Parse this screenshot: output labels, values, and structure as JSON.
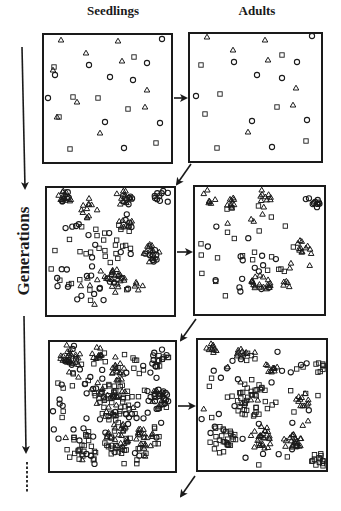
{
  "figure": {
    "column_titles": {
      "seedlings": "Seedlings",
      "adults": "Adults"
    },
    "axis_label": "Generations",
    "colors": {
      "ink": "#1a1a1a",
      "background": "#ffffff"
    },
    "marker_legend": [
      "triangle",
      "circle",
      "square"
    ]
  },
  "panels": [
    {
      "id": "gen1-seedlings",
      "box": [
        43,
        34,
        172,
        163
      ],
      "markers": {
        "triangle": [
          [
            61,
            40
          ],
          [
            118,
            41
          ],
          [
            86,
            53
          ],
          [
            122,
            61
          ],
          [
            147,
            90
          ],
          [
            77,
            102
          ],
          [
            57,
            117
          ],
          [
            145,
            107
          ],
          [
            100,
            133
          ],
          [
            53,
            70
          ]
        ],
        "circle": [
          [
            162,
            39
          ],
          [
            89,
            65
          ],
          [
            147,
            63
          ],
          [
            55,
            75
          ],
          [
            110,
            77
          ],
          [
            133,
            80
          ],
          [
            48,
            98
          ],
          [
            105,
            122
          ],
          [
            160,
            123
          ],
          [
            124,
            148
          ]
        ],
        "square": [
          [
            134,
            57
          ],
          [
            54,
            67
          ],
          [
            73,
            97
          ],
          [
            98,
            98
          ],
          [
            128,
            109
          ],
          [
            59,
            117
          ],
          [
            70,
            149
          ],
          [
            156,
            143
          ]
        ]
      }
    },
    {
      "id": "gen1-adults",
      "box": [
        189,
        33,
        322,
        162
      ],
      "markers": {
        "triangle": [
          [
            207,
            37
          ],
          [
            265,
            40
          ],
          [
            233,
            50
          ],
          [
            268,
            60
          ],
          [
            296,
            88
          ],
          [
            293,
            105
          ],
          [
            248,
            132
          ]
        ],
        "circle": [
          [
            312,
            36
          ],
          [
            234,
            62
          ],
          [
            297,
            62
          ],
          [
            257,
            75
          ],
          [
            282,
            78
          ],
          [
            196,
            96
          ],
          [
            252,
            121
          ],
          [
            307,
            120
          ],
          [
            272,
            147
          ]
        ],
        "square": [
          [
            282,
            55
          ],
          [
            201,
            65
          ],
          [
            220,
            94
          ],
          [
            277,
            107
          ],
          [
            205,
            114
          ],
          [
            217,
            148
          ],
          [
            306,
            141
          ]
        ]
      }
    },
    {
      "id": "gen2-seedlings",
      "box": [
        46,
        187,
        175,
        316
      ],
      "seed": 11,
      "clusters": [
        {
          "type": "triangle",
          "cx": 65,
          "cy": 196,
          "r": 8,
          "n": 14
        },
        {
          "type": "circle",
          "cx": 66,
          "cy": 197,
          "r": 6,
          "n": 5
        },
        {
          "type": "triangle",
          "cx": 89,
          "cy": 208,
          "r": 10,
          "n": 12
        },
        {
          "type": "triangle",
          "cx": 124,
          "cy": 196,
          "r": 9,
          "n": 14
        },
        {
          "type": "circle",
          "cx": 126,
          "cy": 200,
          "r": 8,
          "n": 5
        },
        {
          "type": "circle",
          "cx": 162,
          "cy": 197,
          "r": 9,
          "n": 10
        },
        {
          "type": "triangle",
          "cx": 126,
          "cy": 225,
          "r": 8,
          "n": 8
        },
        {
          "type": "circle",
          "cx": 132,
          "cy": 220,
          "r": 10,
          "n": 5
        },
        {
          "type": "triangle",
          "cx": 151,
          "cy": 253,
          "r": 9,
          "n": 14
        },
        {
          "type": "circle",
          "cx": 149,
          "cy": 255,
          "r": 10,
          "n": 8
        },
        {
          "type": "triangle",
          "cx": 116,
          "cy": 279,
          "r": 10,
          "n": 20
        },
        {
          "type": "circle",
          "cx": 114,
          "cy": 278,
          "r": 8,
          "n": 5
        },
        {
          "type": "triangle",
          "cx": 139,
          "cy": 285,
          "r": 5,
          "n": 5
        },
        {
          "type": "square",
          "cx": 95,
          "cy": 260,
          "r": 45,
          "n": 32
        },
        {
          "type": "circle",
          "cx": 90,
          "cy": 265,
          "r": 45,
          "n": 25
        },
        {
          "type": "triangle",
          "cx": 100,
          "cy": 290,
          "r": 20,
          "n": 8
        }
      ]
    },
    {
      "id": "gen2-adults",
      "box": [
        194,
        186,
        325,
        315
      ],
      "seed": 23,
      "clusters": [
        {
          "type": "triangle",
          "cx": 209,
          "cy": 196,
          "r": 8,
          "n": 7
        },
        {
          "type": "triangle",
          "cx": 231,
          "cy": 203,
          "r": 6,
          "n": 9
        },
        {
          "type": "triangle",
          "cx": 266,
          "cy": 195,
          "r": 7,
          "n": 8
        },
        {
          "type": "circle",
          "cx": 313,
          "cy": 202,
          "r": 8,
          "n": 11
        },
        {
          "type": "triangle",
          "cx": 304,
          "cy": 246,
          "r": 7,
          "n": 10
        },
        {
          "type": "triangle",
          "cx": 261,
          "cy": 283,
          "r": 10,
          "n": 18
        },
        {
          "type": "triangle",
          "cx": 286,
          "cy": 285,
          "r": 4,
          "n": 5
        },
        {
          "type": "triangle",
          "cx": 300,
          "cy": 262,
          "r": 16,
          "n": 5
        },
        {
          "type": "square",
          "cx": 245,
          "cy": 250,
          "r": 50,
          "n": 24
        },
        {
          "type": "circle",
          "cx": 250,
          "cy": 250,
          "r": 50,
          "n": 16
        },
        {
          "type": "triangle",
          "cx": 255,
          "cy": 215,
          "r": 30,
          "n": 6
        }
      ]
    },
    {
      "id": "gen3-seedlings",
      "box": [
        49,
        341,
        176,
        472
      ],
      "seed": 37,
      "clusters": [
        {
          "type": "triangle",
          "cx": 70,
          "cy": 353,
          "r": 11,
          "n": 22
        },
        {
          "type": "circle",
          "cx": 72,
          "cy": 355,
          "r": 10,
          "n": 8
        },
        {
          "type": "triangle",
          "cx": 97,
          "cy": 353,
          "r": 6,
          "n": 12
        },
        {
          "type": "circle",
          "cx": 160,
          "cy": 358,
          "r": 10,
          "n": 10
        },
        {
          "type": "square",
          "cx": 161,
          "cy": 360,
          "r": 8,
          "n": 8
        },
        {
          "type": "triangle",
          "cx": 118,
          "cy": 372,
          "r": 9,
          "n": 14
        },
        {
          "type": "circle",
          "cx": 158,
          "cy": 398,
          "r": 11,
          "n": 20
        },
        {
          "type": "triangle",
          "cx": 158,
          "cy": 398,
          "r": 10,
          "n": 10
        },
        {
          "type": "square",
          "cx": 113,
          "cy": 400,
          "r": 20,
          "n": 40
        },
        {
          "type": "triangle",
          "cx": 110,
          "cy": 400,
          "r": 14,
          "n": 14
        },
        {
          "type": "triangle",
          "cx": 118,
          "cy": 436,
          "r": 13,
          "n": 24
        },
        {
          "type": "square",
          "cx": 118,
          "cy": 440,
          "r": 14,
          "n": 18
        },
        {
          "type": "triangle",
          "cx": 145,
          "cy": 438,
          "r": 11,
          "n": 16
        },
        {
          "type": "square",
          "cx": 82,
          "cy": 450,
          "r": 16,
          "n": 22
        },
        {
          "type": "circle",
          "cx": 110,
          "cy": 410,
          "r": 60,
          "n": 50
        },
        {
          "type": "square",
          "cx": 110,
          "cy": 410,
          "r": 60,
          "n": 50
        },
        {
          "type": "triangle",
          "cx": 110,
          "cy": 410,
          "r": 60,
          "n": 15
        }
      ]
    },
    {
      "id": "gen3-adults",
      "box": [
        197,
        339,
        327,
        471
      ],
      "seed": 53,
      "clusters": [
        {
          "type": "triangle",
          "cx": 212,
          "cy": 347,
          "r": 7,
          "n": 10
        },
        {
          "type": "triangle",
          "cx": 241,
          "cy": 352,
          "r": 6,
          "n": 10
        },
        {
          "type": "triangle",
          "cx": 271,
          "cy": 367,
          "r": 6,
          "n": 10
        },
        {
          "type": "triangle",
          "cx": 303,
          "cy": 400,
          "r": 7,
          "n": 12
        },
        {
          "type": "square",
          "cx": 252,
          "cy": 400,
          "r": 18,
          "n": 38
        },
        {
          "type": "square",
          "cx": 222,
          "cy": 440,
          "r": 14,
          "n": 26
        },
        {
          "type": "triangle",
          "cx": 262,
          "cy": 438,
          "r": 12,
          "n": 26
        },
        {
          "type": "triangle",
          "cx": 292,
          "cy": 443,
          "r": 10,
          "n": 20
        },
        {
          "type": "square",
          "cx": 318,
          "cy": 460,
          "r": 8,
          "n": 14
        },
        {
          "type": "square",
          "cx": 320,
          "cy": 365,
          "r": 8,
          "n": 8
        },
        {
          "type": "circle",
          "cx": 262,
          "cy": 405,
          "r": 62,
          "n": 28
        },
        {
          "type": "square",
          "cx": 262,
          "cy": 405,
          "r": 62,
          "n": 22
        },
        {
          "type": "triangle",
          "cx": 262,
          "cy": 405,
          "r": 62,
          "n": 12
        }
      ]
    }
  ],
  "arrows": {
    "horizontal": [
      [
        174,
        98,
        186,
        98
      ],
      [
        177,
        252,
        191,
        252
      ],
      [
        178,
        406,
        194,
        406
      ]
    ],
    "diagonal": [
      [
        191,
        164,
        177,
        184
      ],
      [
        196,
        319,
        181,
        340
      ],
      [
        195,
        476,
        181,
        496
      ]
    ],
    "timeline": {
      "x": 24,
      "upper": [
        22,
        47,
        25,
        188
      ],
      "lower": [
        24,
        316,
        26,
        452
      ],
      "dashed": [
        27,
        462,
        27,
        492
      ]
    }
  }
}
